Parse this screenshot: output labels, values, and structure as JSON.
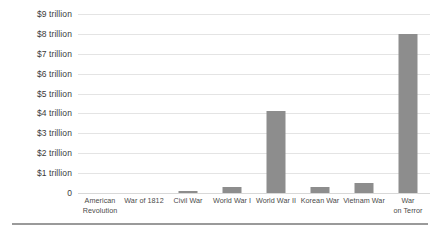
{
  "chart_data": {
    "type": "bar",
    "title": "",
    "xlabel": "",
    "ylabel": "",
    "categories": [
      "American Revolution",
      "War of 1812",
      "Civil War",
      "World War I",
      "World War II",
      "Korean War",
      "Vietnam War",
      "War on Terror"
    ],
    "category_lines": [
      [
        "American",
        "Revolution"
      ],
      [
        "War of 1812"
      ],
      [
        "Civil War"
      ],
      [
        "World War I"
      ],
      [
        "World War II"
      ],
      [
        "Korean War"
      ],
      [
        "Vietnam War"
      ],
      [
        "War",
        "on Terror"
      ]
    ],
    "values": [
      0.0,
      0.0,
      0.1,
      0.3,
      4.1,
      0.3,
      0.5,
      8.0
    ],
    "value_unit": "trillion USD",
    "ylim": [
      0,
      9
    ],
    "ytick_values": [
      9,
      8,
      7,
      6,
      5,
      4,
      3,
      2,
      1,
      0
    ],
    "ytick_labels": [
      "$9 trillion",
      "$8 trillion",
      "$7 trillion",
      "$6 trillion",
      "$5 trillion",
      "$4 trillion",
      "$3 trillion",
      "$2 trillion",
      "$1 trillion",
      "0"
    ],
    "grid": true,
    "legend": false,
    "bar_color": "#8d8d8d",
    "gridline_color": "#e4e4e4",
    "background_color": "#ffffff"
  }
}
